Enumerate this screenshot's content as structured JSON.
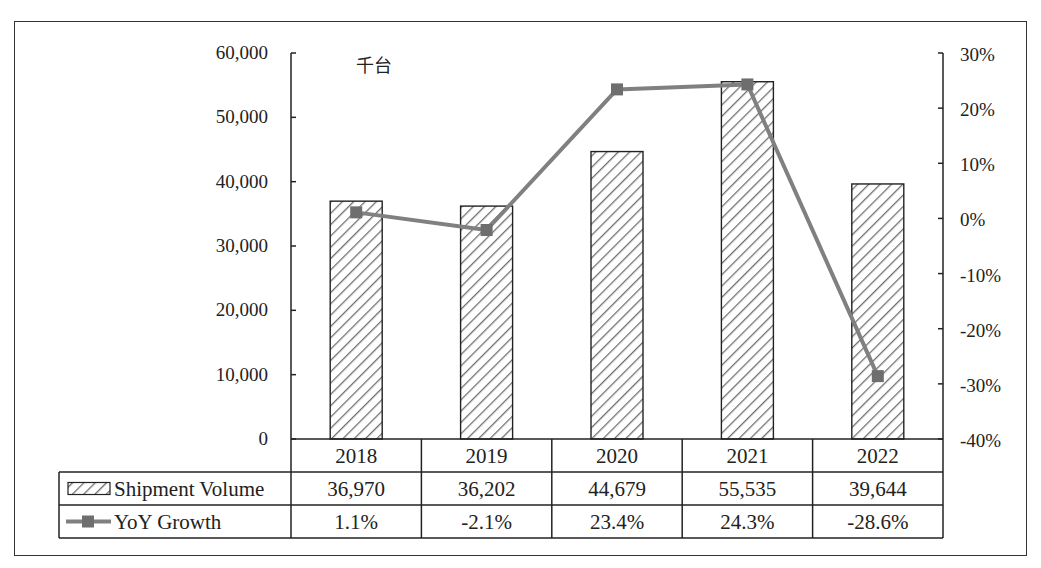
{
  "chart_data": {
    "type": "bar",
    "title": "",
    "unit_label": "千台",
    "categories": [
      "2018",
      "2019",
      "2020",
      "2021",
      "2022"
    ],
    "series": [
      {
        "name": "Shipment Volume",
        "type": "bar",
        "axis": "left",
        "values": [
          36970,
          36202,
          44679,
          55535,
          39644
        ],
        "labels": [
          "36,970",
          "36,202",
          "44,679",
          "55,535",
          "39,644"
        ],
        "pattern": "diagonal-hatch"
      },
      {
        "name": "YoY Growth",
        "type": "line",
        "axis": "right",
        "values": [
          1.1,
          -2.1,
          23.4,
          24.3,
          -28.6
        ],
        "labels": [
          "1.1%",
          "-2.1%",
          "23.4%",
          "24.3%",
          "-28.6%"
        ],
        "marker": "square"
      }
    ],
    "left_axis": {
      "ylim": [
        0,
        60000
      ],
      "ticks": [
        0,
        10000,
        20000,
        30000,
        40000,
        50000,
        60000
      ],
      "tick_labels": [
        "0",
        "10,000",
        "20,000",
        "30,000",
        "40,000",
        "50,000",
        "60,000"
      ]
    },
    "right_axis": {
      "ylim": [
        -40,
        30
      ],
      "ticks": [
        -40,
        -30,
        -20,
        -10,
        0,
        10,
        20,
        30
      ],
      "tick_labels": [
        "-40%",
        "-30%",
        "-20%",
        "-10%",
        "0%",
        "10%",
        "20%",
        "30%"
      ]
    },
    "xlabel": "",
    "ylabel": "",
    "grid": false,
    "legend_position": "data-table",
    "data_table": true
  },
  "colors": {
    "bar_outline": "#222222",
    "hatch": "#6f6f6f",
    "line": "#808080",
    "marker": "#6e6e6e",
    "axis": "#222222"
  }
}
